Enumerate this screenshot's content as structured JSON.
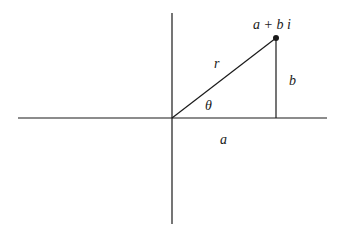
{
  "diagram": {
    "labels": {
      "point": "a + b i",
      "radius": "r",
      "angle": "θ",
      "real_part": "a",
      "imag_part": "b"
    },
    "colors": {
      "stroke": "#1a1a1a",
      "background": "#ffffff"
    }
  }
}
